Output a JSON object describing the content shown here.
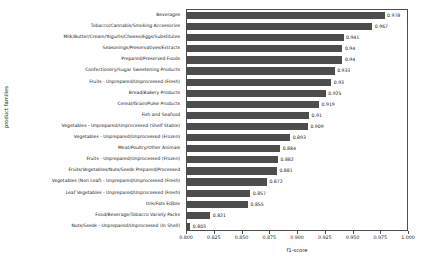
{
  "chart_data": {
    "type": "bar",
    "orientation": "horizontal",
    "title": "",
    "xlabel": "f1-score",
    "ylabel": "product families",
    "xlim": [
      0.8,
      1.0
    ],
    "xticks": [
      "0.800",
      "0.825",
      "0.850",
      "0.875",
      "0.900",
      "0.925",
      "0.950",
      "0.975",
      "1.000"
    ],
    "xtick_values": [
      0.8,
      0.825,
      0.85,
      0.875,
      0.9,
      0.925,
      0.95,
      0.975,
      1.0
    ],
    "grid": false,
    "legend": null,
    "bar_color": "#4d4d4d",
    "categories": [
      "Beverages",
      "Tobacco/Cannabis/Smoking Accessories",
      "Milk/Butter/Cream/Yogurts/Cheese/Eggs/Substitutes",
      "Seasonings/Preservatives/Extracts",
      "Prepared/Preserved Foods",
      "Confectionery/Sugar Sweetening Products",
      "Fruits - Unprepared/Unprocessed (Fresh)",
      "Bread/Bakery Products",
      "Cereal/Grain/Pulse Products",
      "Fish and Seafood",
      "Vegetables - Unprepared/Unprocessed (Shelf Stable)",
      "Vegetables - Unprepared/Unprocessed (Frozen)",
      "Meat/Poultry/Other Animals",
      "Fruits - Unprepared/Unprocessed (Frozen)",
      "Fruits/Vegetables/Nuts/Seeds Prepared/Processed",
      "Vegetables (Non Leaf) - Unprepared/Unprocessed (Fresh)",
      "Leaf Vegetables - Unprepared/Unprocessed (Fresh)",
      "Oils/Fats Edible",
      "Food/Beverage/Tobacco Variety Packs",
      "Nuts/Seeds - Unprepared/Unprocessed (In Shell)"
    ],
    "values": [
      0.978,
      0.967,
      0.941,
      0.94,
      0.94,
      0.933,
      0.93,
      0.925,
      0.919,
      0.91,
      0.909,
      0.893,
      0.884,
      0.882,
      0.881,
      0.872,
      0.857,
      0.855,
      0.821,
      0.803
    ],
    "value_labels": [
      "0.978",
      "0.967",
      "0.941",
      "0.94",
      "0.94",
      "0.933",
      "0.93",
      "0.925",
      "0.919",
      "0.91",
      "0.909",
      "0.893",
      "0.884",
      "0.882",
      "0.881",
      "0.872",
      "0.857",
      "0.855",
      "0.821",
      "0.803"
    ]
  }
}
